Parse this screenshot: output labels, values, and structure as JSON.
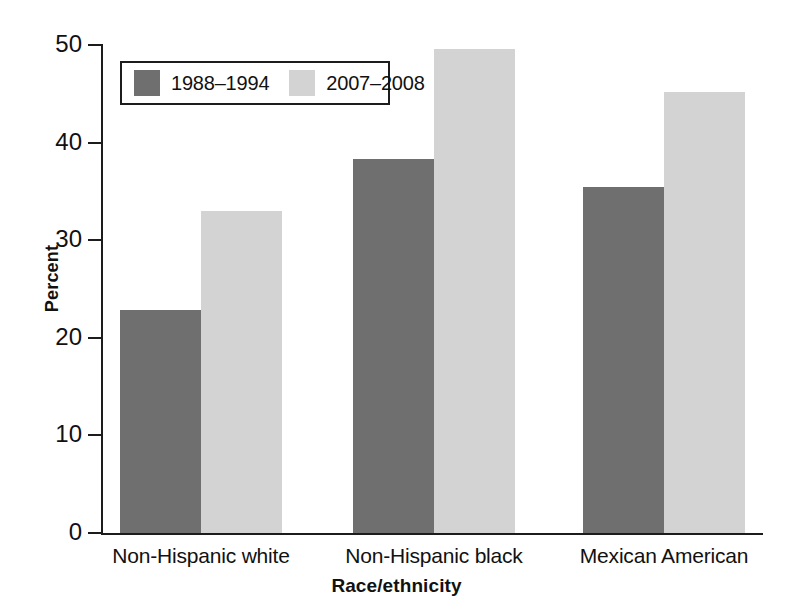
{
  "chart_data": {
    "type": "bar",
    "title": "",
    "xlabel": "Race/ethnicity",
    "ylabel": "Percent",
    "categories": [
      "Non-Hispanic white",
      "Non-Hispanic black",
      "Mexican American"
    ],
    "series": [
      {
        "name": "1988–1994",
        "color": "#6f6f6f",
        "values": [
          22.8,
          38.3,
          35.4
        ]
      },
      {
        "name": "2007–2008",
        "color": "#d3d3d3",
        "values": [
          33.0,
          49.6,
          45.2
        ]
      }
    ],
    "ylim": [
      0,
      50
    ],
    "yticks": [
      0,
      10,
      20,
      30,
      40,
      50
    ],
    "ytick_labels": [
      "0",
      "10",
      "20",
      "30",
      "40",
      "50"
    ],
    "grid": false,
    "legend_position": "upper left, inside plot area, boxed"
  },
  "axes": {
    "y_title": "Percent",
    "x_title": "Race/ethnicity"
  },
  "legend": {
    "entries": [
      {
        "label": "1988–1994",
        "swatch": "dark-gray-swatch"
      },
      {
        "label": "2007–2008",
        "swatch": "light-gray-swatch"
      }
    ]
  },
  "colors": {
    "series_1": "#6f6f6f",
    "series_2": "#d3d3d3",
    "axis": "#1c1c1c",
    "background": "#ffffff"
  }
}
